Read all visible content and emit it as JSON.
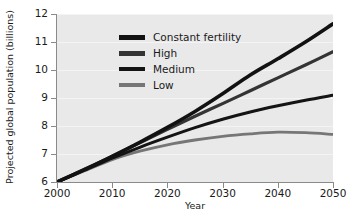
{
  "chart_data": {
    "type": "line",
    "title": "",
    "xlabel": "Year",
    "ylabel": "Projected global population (billions)",
    "xlim": [
      2000,
      2050
    ],
    "ylim": [
      6,
      12
    ],
    "xticks": [
      2000,
      2010,
      2020,
      2030,
      2040,
      2050
    ],
    "yticks": [
      6,
      7,
      8,
      9,
      10,
      11,
      12
    ],
    "grid": "horizontal",
    "legend_position": "upper-left",
    "x": [
      2000,
      2005,
      2010,
      2015,
      2020,
      2025,
      2030,
      2035,
      2040,
      2045,
      2050
    ],
    "series": [
      {
        "name": "Constant fertility",
        "color": "#121212",
        "width": 3.6,
        "values": [
          6.0,
          6.45,
          6.92,
          7.42,
          7.95,
          8.52,
          9.15,
          9.82,
          10.4,
          11.0,
          11.65
        ]
      },
      {
        "name": "High",
        "color": "#343434",
        "width": 3.2,
        "values": [
          6.0,
          6.45,
          6.92,
          7.4,
          7.88,
          8.35,
          8.8,
          9.26,
          9.72,
          10.18,
          10.65
        ]
      },
      {
        "name": "Medium",
        "color": "#141414",
        "width": 3.0,
        "values": [
          6.0,
          6.42,
          6.85,
          7.24,
          7.6,
          7.94,
          8.24,
          8.5,
          8.72,
          8.92,
          9.1
        ]
      },
      {
        "name": "Low",
        "color": "#767676",
        "width": 2.8,
        "values": [
          6.0,
          6.4,
          6.8,
          7.1,
          7.33,
          7.5,
          7.63,
          7.72,
          7.78,
          7.76,
          7.7
        ]
      }
    ]
  },
  "legend": {
    "items": [
      {
        "label": "Constant fertility",
        "color": "#121212",
        "thickness": 5
      },
      {
        "label": "High",
        "color": "#343434",
        "thickness": 5
      },
      {
        "label": "Medium",
        "color": "#141414",
        "thickness": 4
      },
      {
        "label": "Low",
        "color": "#767676",
        "thickness": 4
      }
    ]
  },
  "axes": {
    "x_label": "Year",
    "y_label": "Projected global population (billions)",
    "x_tick_labels": [
      "2000",
      "2010",
      "2020",
      "2030",
      "2040",
      "2050"
    ],
    "y_tick_labels": [
      "6",
      "7",
      "8",
      "9",
      "10",
      "11",
      "12"
    ]
  },
  "colors": {
    "plot_background": "#e9e9e9",
    "figure_background": "#ffffff",
    "gridline": "#f4f4f4",
    "spine": "#8a8a8a",
    "text": "#1a1a1a"
  }
}
